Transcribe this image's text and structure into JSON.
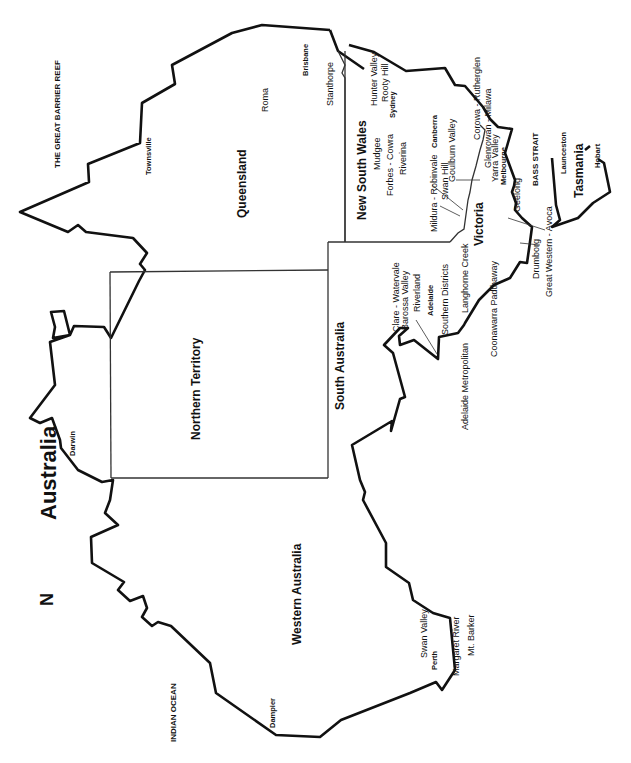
{
  "map": {
    "title": "Australia",
    "north_arrow": "N",
    "oceans": {
      "great_barrier_reef": "THE GREAT BARRIER REEF",
      "indian_ocean": "INDIAN OCEAN",
      "bass_strait": "BASS STRAIT"
    },
    "states": {
      "queensland": "Queensland",
      "northern_territory": "Northern Territory",
      "western_australia": "Western Australia",
      "south_australia": "South Australia",
      "new_south_wales": "New South Wales",
      "victoria": "Victoria",
      "tasmania": "Tasmania"
    },
    "cities": {
      "brisbane": "Brisbane",
      "townsville": "Townsville",
      "darwin": "Darwin",
      "dampier": "Dampier",
      "perth": "Perth",
      "adelaide": "Adelaide",
      "melbourne": "Melbourne",
      "sydney": "Sydney",
      "canberra": "Canberra",
      "launceston": "Launceston",
      "hobart": "Hobart"
    },
    "regions": {
      "roma": "Roma",
      "stanthorpe": "Stanthorpe",
      "hunter_valley": "Hunter Valley",
      "rooty_hill": "Rooty Hill",
      "mudgee": "Mudgee",
      "forbes_cowra": "Forbes - Cowra",
      "riverina": "Riverina",
      "goulburn_valley": "Goulburn Valley",
      "mildura_robinvale": "Mildura - Robinvale",
      "swan_hill": "Swan Hill",
      "corowa_rutherglen": "Corowa - Rutherglen",
      "glenrowan_milawa": "Glenrowan - Milawa",
      "yarra_valley": "Yarra Valley",
      "geelong": "Geelong",
      "drumborg": "Drumborg",
      "great_western_avoca": "Great Western - Avoca",
      "langhorne_creek": "Langhorne Creek",
      "coonawarra_padthaway": "Coonawarra Padthaway",
      "clare_watervale": "Clare - Watervale",
      "barossa_valley": "Barossa Valley",
      "riverland": "Riverland",
      "southern_districts": "Southern Districts",
      "adelaide_metropolitan": "Adelaide Metropolitan",
      "swan_valley": "Swan Valley",
      "margaret_river": "Margaret River",
      "mt_barker": "Mt. Barker"
    }
  }
}
